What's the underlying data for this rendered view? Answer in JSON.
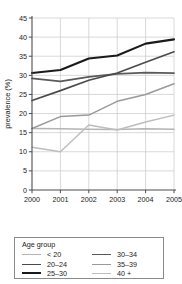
{
  "chart_data": {
    "type": "line",
    "title": "",
    "xlabel": "year",
    "ylabel": "prevalence (%)",
    "x": [
      2000,
      2001,
      2002,
      2003,
      2004,
      2005
    ],
    "xtick_labels": [
      "2000",
      "2001",
      "2002",
      "2003",
      "2004",
      "2005"
    ],
    "xlim": [
      2000,
      2005
    ],
    "ylim": [
      0,
      45
    ],
    "ytick_labels": [
      "0",
      "5",
      "10",
      "15",
      "20",
      "25",
      "30",
      "35",
      "40",
      "45"
    ],
    "yticks": [
      0,
      5,
      10,
      15,
      20,
      25,
      30,
      35,
      40,
      45
    ],
    "grid": true,
    "legend_position": "below-plot",
    "legend_title": "Age group",
    "series": [
      {
        "name": "< 20",
        "color": "#b4b4b4",
        "width": 1.5,
        "values": [
          16.1,
          16.0,
          15.9,
          15.8,
          16.0,
          15.9
        ]
      },
      {
        "name": "20-24",
        "color": "#4a4a4a",
        "width": 1.6,
        "values": [
          23.4,
          26.0,
          28.7,
          30.6,
          33.4,
          36.2
        ]
      },
      {
        "name": "25-30",
        "color": "#1a1a1a",
        "width": 2.1,
        "values": [
          30.6,
          31.4,
          34.4,
          35.2,
          38.3,
          39.4
        ]
      },
      {
        "name": "30-34",
        "color": "#5a5a5a",
        "width": 1.8,
        "values": [
          29.2,
          28.4,
          29.6,
          30.4,
          30.7,
          30.6
        ]
      },
      {
        "name": "35-39",
        "color": "#9a9a9a",
        "width": 1.5,
        "values": [
          16.1,
          19.2,
          19.6,
          23.2,
          25.0,
          27.8
        ]
      },
      {
        "name": "40+",
        "color": "#bdbdbd",
        "width": 1.4,
        "values": [
          11.2,
          10.0,
          17.0,
          15.7,
          17.8,
          19.6
        ]
      }
    ]
  },
  "legend": {
    "title": "Age group",
    "left_column": [
      {
        "label": "< 20",
        "series_index": 0
      },
      {
        "label": "20–24",
        "series_index": 1
      },
      {
        "label": "25–30",
        "series_index": 2
      }
    ],
    "right_column": [
      {
        "label": "30–34",
        "series_index": 3
      },
      {
        "label": "35–39",
        "series_index": 4
      },
      {
        "label": "40 +",
        "series_index": 5
      }
    ]
  }
}
